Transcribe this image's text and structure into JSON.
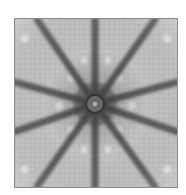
{
  "image": {
    "description": "Grayscale kaleidoscopic star pattern with dark rays radiating from a central ring over a fine cellular mesh texture",
    "colors": {
      "background": "#ffffff",
      "field": "#bdbdbd",
      "ray": "#4a4a4a",
      "bright_spot": "#eaeaea",
      "border": "#8a8a8a"
    },
    "center": {
      "x": 81,
      "y": 86
    },
    "rays": [
      {
        "x2": 81,
        "y2": 0
      },
      {
        "x2": 81,
        "y2": 170
      },
      {
        "x2": 0,
        "y2": 64
      },
      {
        "x2": 0,
        "y2": 114
      },
      {
        "x2": 164,
        "y2": 64
      },
      {
        "x2": 164,
        "y2": 114
      },
      {
        "x2": 22,
        "y2": 0
      },
      {
        "x2": 142,
        "y2": 0
      },
      {
        "x2": 22,
        "y2": 170
      },
      {
        "x2": 142,
        "y2": 170
      }
    ]
  }
}
